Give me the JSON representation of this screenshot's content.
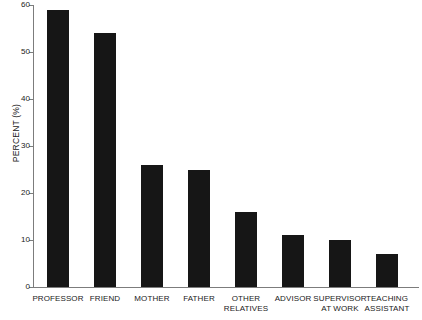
{
  "chart_data": {
    "type": "bar",
    "title": "",
    "xlabel": "",
    "ylabel": "PERCENT (%)",
    "ylim": [
      0,
      60
    ],
    "yticks": [
      0,
      10,
      20,
      30,
      40,
      50,
      60
    ],
    "ytick_labels": [
      "0",
      "10",
      "20",
      "30",
      "40",
      "50",
      "60"
    ],
    "grid": false,
    "legend": null,
    "bar_color": "#161616",
    "axis_color": "#7c7c7c",
    "background": "#ffffff",
    "categories": [
      "PROFESSOR",
      "FRIEND",
      "MOTHER",
      "FATHER",
      "OTHER RELATIVES",
      "ADVISOR",
      "SUPERVISOR AT WORK",
      "TEACHING ASSISTANT"
    ],
    "category_lines": [
      [
        "PROFESSOR"
      ],
      [
        "FRIEND"
      ],
      [
        "MOTHER"
      ],
      [
        "FATHER"
      ],
      [
        "OTHER",
        "RELATIVES"
      ],
      [
        "ADVISOR"
      ],
      [
        "SUPERVISOR",
        "AT WORK"
      ],
      [
        "TEACHING",
        "ASSISTANT"
      ]
    ],
    "values": [
      59,
      54,
      26,
      25,
      16,
      11,
      10,
      7
    ]
  }
}
